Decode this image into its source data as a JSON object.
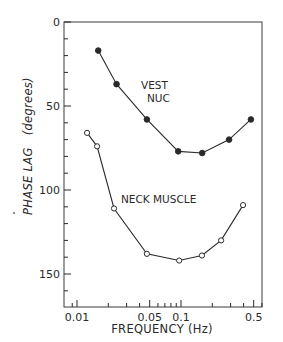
{
  "chart_data": {
    "type": "line",
    "title": "",
    "xlabel": "FREQUENCY (Hz)",
    "ylabel": "PHASE LAG",
    "ylabel_units": "(degrees)",
    "xscale": "log",
    "xlim": [
      0.0085,
      0.63
    ],
    "ylim": [
      170,
      0
    ],
    "y_inverted": true,
    "grid": false,
    "legend_position": "inline labels",
    "x_ticks": [
      0.01,
      0.05,
      0.1,
      0.5
    ],
    "x_tick_labels": [
      "0.01",
      "0.05",
      "0.1",
      "0.5"
    ],
    "y_ticks": [
      0,
      50,
      100,
      150
    ],
    "y_tick_labels": [
      "0",
      "50",
      "100",
      "150"
    ],
    "series": [
      {
        "name": "VEST NUC",
        "label_lines": [
          "VEST",
          "NUC"
        ],
        "marker": "filled-circle",
        "x": [
          0.016,
          0.024,
          0.047,
          0.094,
          0.16,
          0.29,
          0.47
        ],
        "values": [
          17,
          37,
          58,
          77,
          78,
          70,
          58
        ]
      },
      {
        "name": "NECK MUSCLE",
        "label_lines": [
          "NECK MUSCLE"
        ],
        "marker": "open-circle",
        "x": [
          0.0125,
          0.0156,
          0.0227,
          0.047,
          0.096,
          0.159,
          0.243,
          0.395
        ],
        "values": [
          66,
          74,
          111,
          138,
          142,
          139,
          130,
          109
        ]
      }
    ]
  },
  "colors": {
    "ink": "#2a2a2a",
    "background": "#ffffff"
  }
}
